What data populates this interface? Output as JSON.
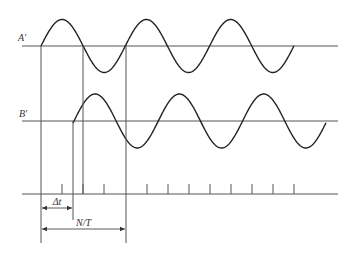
{
  "diagram": {
    "colors": {
      "line": "#555555",
      "wave": "#222222"
    },
    "labels": {
      "a": "A'",
      "b": "B'",
      "delta_t": "Δt",
      "n_over_t": "N/T"
    },
    "signal_a": {
      "axis_y": 46,
      "axis_x0": 22,
      "axis_x1": 338,
      "x_start": 41,
      "x_end": 294,
      "period": 84.3,
      "amplitude": 26.5,
      "phase_x": 41
    },
    "signal_b": {
      "axis_y": 121,
      "axis_x0": 22,
      "axis_x1": 338,
      "x_start": 73,
      "x_end": 326,
      "period": 84.3,
      "amplitude": 27,
      "phase_x": 74
    },
    "time_axis": {
      "y": 194,
      "x0": 22,
      "x1": 338,
      "tick_height": 10,
      "ticks": [
        62,
        83,
        104,
        147,
        168,
        189,
        210,
        231,
        252,
        273,
        294
      ]
    },
    "vertical_lines": [
      {
        "x": 41,
        "y0": 46,
        "y1": 243
      },
      {
        "x": 73,
        "y0": 121,
        "y1": 220
      },
      {
        "x": 83,
        "y0": 46,
        "y1": 194
      },
      {
        "x": 126,
        "y0": 46,
        "y1": 243
      }
    ],
    "dimensions": [
      {
        "label_key": "delta_t",
        "x0": 41,
        "x1": 73,
        "y": 208
      },
      {
        "label_key": "n_over_t",
        "x0": 41,
        "x1": 126,
        "y": 229
      }
    ]
  }
}
